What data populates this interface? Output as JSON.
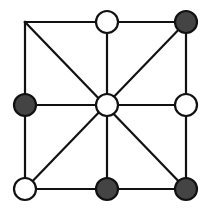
{
  "game": {
    "type": "three-mens-morris",
    "grid": {
      "cols": [
        25,
        107,
        186
      ],
      "rows": [
        22,
        105,
        189
      ]
    },
    "stone_radius": 11,
    "colors": {
      "black": "#444444",
      "white": "#ffffff",
      "line": "#111111",
      "background": "#ffffff"
    },
    "lines": [
      {
        "name": "top-edge",
        "from": [
          0,
          0
        ],
        "to": [
          2,
          0
        ]
      },
      {
        "name": "middle-row",
        "from": [
          0,
          1
        ],
        "to": [
          2,
          1
        ]
      },
      {
        "name": "bottom-edge",
        "from": [
          0,
          2
        ],
        "to": [
          2,
          2
        ]
      },
      {
        "name": "left-edge",
        "from": [
          0,
          0
        ],
        "to": [
          0,
          2
        ]
      },
      {
        "name": "middle-column",
        "from": [
          1,
          0
        ],
        "to": [
          1,
          2
        ]
      },
      {
        "name": "right-edge",
        "from": [
          2,
          0
        ],
        "to": [
          2,
          2
        ]
      },
      {
        "name": "diagonal-main",
        "from": [
          0,
          0
        ],
        "to": [
          2,
          2
        ]
      },
      {
        "name": "diagonal-anti",
        "from": [
          2,
          0
        ],
        "to": [
          0,
          2
        ]
      }
    ],
    "board": [
      [
        "empty",
        "white",
        "black"
      ],
      [
        "black",
        "white",
        "white"
      ],
      [
        "white",
        "black",
        "black"
      ]
    ],
    "counts": {
      "black": 4,
      "white": 4,
      "empty": 1
    }
  }
}
